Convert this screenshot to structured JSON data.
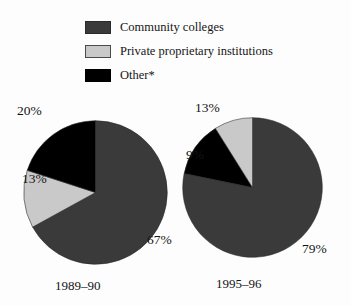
{
  "legend": {
    "items": [
      {
        "label": "Community colleges",
        "icon": "square-swatch-icon",
        "color": "#3a3a3a"
      },
      {
        "label": "Private proprietary institutions",
        "icon": "square-swatch-icon",
        "color": "#c9c9c9"
      },
      {
        "label": "Other*",
        "icon": "square-swatch-icon",
        "color": "#000000"
      }
    ]
  },
  "chart_data": {
    "type": "pie",
    "title": "",
    "xlabel": "",
    "ylabel": "",
    "legend_position": "top",
    "categories": [
      "Community colleges",
      "Private proprietary institutions",
      "Other*"
    ],
    "colors": [
      "#3a3a3a",
      "#c9c9c9",
      "#000000"
    ],
    "charts": [
      {
        "name": "1989-90",
        "label": "1989–90",
        "values": [
          67,
          13,
          20
        ],
        "value_labels": [
          "67%",
          "13%",
          "20%"
        ],
        "start_angle_deg": 0,
        "direction": "clockwise"
      },
      {
        "name": "1995-96",
        "label": "1995–96",
        "values": [
          79,
          9,
          13
        ],
        "value_labels": [
          "79%",
          "9%",
          "13%"
        ],
        "slice_order": [
          "Community colleges",
          "Other*",
          "Private proprietary institutions"
        ],
        "start_angle_deg": 0,
        "direction": "clockwise"
      }
    ]
  },
  "pies": {
    "left": {
      "year": "1989–90",
      "community_pct": "67%",
      "private_pct": "13%",
      "other_pct": "20%"
    },
    "right": {
      "year": "1995–96",
      "community_pct": "79%",
      "private_pct": "9%",
      "other_pct": "13%"
    }
  }
}
